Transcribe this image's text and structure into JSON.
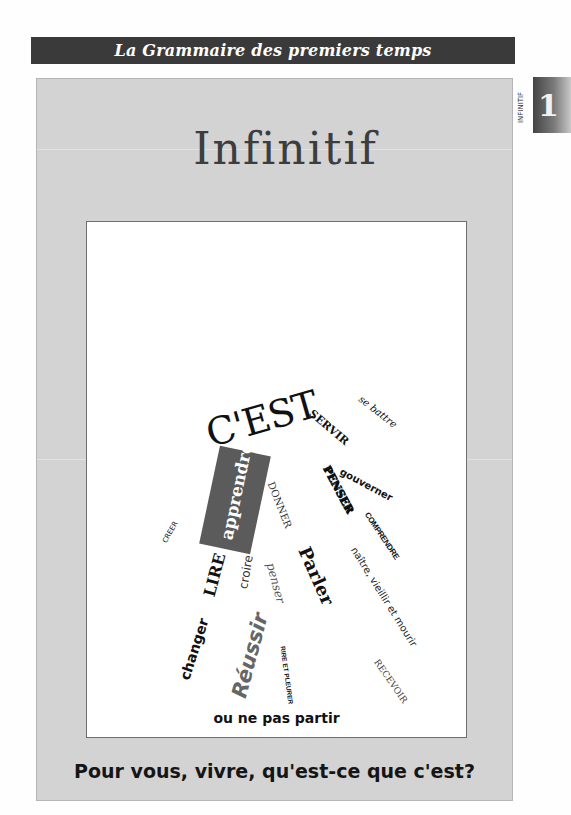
{
  "header": {
    "title": "La Grammaire des premiers temps"
  },
  "side_tab": {
    "label": "INFINITIF",
    "number": "1"
  },
  "page": {
    "title": "Infinitif"
  },
  "word_cloud": {
    "words": [
      {
        "text": "C'EST"
      },
      {
        "text": "SERVIR"
      },
      {
        "text": "se battre"
      },
      {
        "text": "apprendre"
      },
      {
        "text": "DONNER"
      },
      {
        "text": "PENSER"
      },
      {
        "text": "gouverner"
      },
      {
        "text": "COMPRENDRE"
      },
      {
        "text": "naître, vieillir et mourir"
      },
      {
        "text": "CREER"
      },
      {
        "text": "LIRE"
      },
      {
        "text": "croire"
      },
      {
        "text": "penser"
      },
      {
        "text": "Parler"
      },
      {
        "text": "changer"
      },
      {
        "text": "Réussir"
      },
      {
        "text": "RIRE ET PLEURER"
      },
      {
        "text": "RECEVOIR"
      },
      {
        "text": "ou ne pas partir"
      }
    ]
  },
  "question": {
    "text": "Pour vous, vivre, qu'est-ce que c'est?"
  },
  "colors": {
    "header_bg": "#3a3a3a",
    "panel_bg": "#d3d3d3",
    "highlight_box": "#5b5b5b"
  }
}
